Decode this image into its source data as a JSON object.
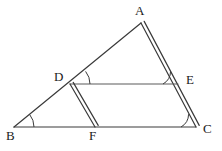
{
  "figure": {
    "background_color": "#ffffff",
    "stroke_color": "#3a3a3a",
    "label_color": "#1a1a1a",
    "width": 222,
    "height": 151
  },
  "points": {
    "A": {
      "label": "A",
      "x": 141,
      "y": 23,
      "label_x": 135,
      "label_y": 4
    },
    "B": {
      "label": "B",
      "x": 14,
      "y": 127,
      "label_x": 6,
      "label_y": 129
    },
    "C": {
      "label": "C",
      "x": 196,
      "y": 127,
      "label_x": 203,
      "label_y": 122
    },
    "D": {
      "label": "D",
      "x": 70,
      "y": 84,
      "label_x": 54,
      "label_y": 70
    },
    "E": {
      "label": "E",
      "x": 178,
      "y": 84,
      "label_x": 186,
      "label_y": 73
    },
    "F": {
      "label": "F",
      "x": 95,
      "y": 127,
      "label_x": 89,
      "label_y": 129
    }
  },
  "segments": [
    {
      "name": "AB",
      "from": "A",
      "to": "B",
      "style": "single",
      "note": "side of triangle"
    },
    {
      "name": "AC",
      "from": "A",
      "to": "C",
      "style": "double",
      "note": "marked parallel to DF"
    },
    {
      "name": "BC",
      "from": "B",
      "to": "C",
      "style": "single",
      "note": "base of triangle"
    },
    {
      "name": "DE",
      "from": "D",
      "to": "E",
      "style": "single",
      "note": "parallel to BC"
    },
    {
      "name": "DF",
      "from": "D",
      "to": "F",
      "style": "double",
      "note": "marked parallel to AC"
    }
  ],
  "angle_marks": [
    {
      "name": "angle-at-B",
      "vertex": "B",
      "type": "arc"
    },
    {
      "name": "angle-at-D",
      "vertex": "D",
      "type": "arc"
    },
    {
      "name": "angle-at-E",
      "vertex": "E",
      "type": "tick"
    },
    {
      "name": "angle-at-C",
      "vertex": "C",
      "type": "tick"
    }
  ]
}
